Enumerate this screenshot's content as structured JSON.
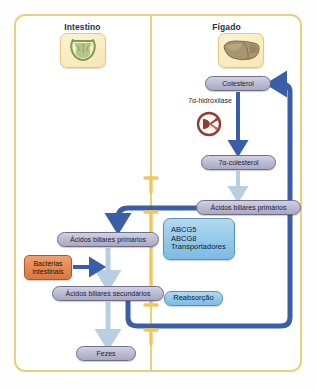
{
  "diagram": {
    "panels": [
      {
        "id": "intestine",
        "label": "Intestino",
        "organ_icon": "intestine-illustration"
      },
      {
        "id": "liver",
        "label": "Fígado",
        "organ_icon": "liver-illustration"
      }
    ],
    "nodes": {
      "colesterol": "Colesterol",
      "alpha_colesterol": "7α-colesterol",
      "acidos_primarios_figado": "Ácidos biliares primários",
      "acidos_primarios_intestino": "Ácidos biliares primários",
      "acidos_secundarios": "Ácidos biliares secundários",
      "fezes": "Fezes",
      "bacterias_linha1": "Bactérias",
      "bacterias_linha2": "intestinais",
      "reabsorcao": "Reabsorção",
      "transportador_1": "ABCG5",
      "transportador_2": "ABCG8",
      "transportador_3": "Transportadores"
    },
    "enzyme": {
      "label": "7α-hidroxilase",
      "icon": "enzyme-circle-icon"
    },
    "colors": {
      "panel_border": "#eacf7e",
      "arrow_dark_blue": "#3b5ea8",
      "arrow_light_blue": "#b8cfe2",
      "node_pill": "#b9b9d0",
      "transporter_blue": "#8fc6e8",
      "bacteria_orange": "#e2854f",
      "enzyme_red": "#8f3b33",
      "membrane_gold": "#f0c85a"
    }
  }
}
